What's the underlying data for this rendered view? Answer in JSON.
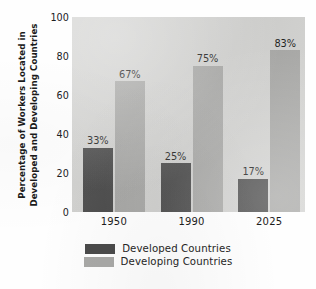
{
  "chart_data": {
    "type": "bar",
    "title": "",
    "subtitle": "",
    "xlabel": "",
    "ylabel_lines": [
      "Percentage of Workers Located in",
      "Developed and Developing Countries"
    ],
    "categories": [
      "1950",
      "1990",
      "2025"
    ],
    "series": [
      {
        "name": "Developed Countries",
        "color": "#4b4b4b",
        "values": [
          33,
          25,
          17
        ],
        "data_labels": [
          "33%",
          "25%",
          "17%"
        ]
      },
      {
        "name": "Developing Countries",
        "color": "#a9a9a7",
        "values": [
          67,
          75,
          83
        ],
        "data_labels": [
          "67%",
          "75%",
          "83%"
        ]
      }
    ],
    "ylim": [
      0,
      100
    ],
    "yticks": [
      0,
      20,
      40,
      60,
      80,
      100
    ],
    "ytick_labels": [
      "0",
      "20",
      "40",
      "60",
      "80",
      "100"
    ],
    "grid": false,
    "legend_position": "bottom",
    "plot_background": "#d3d3d1",
    "page_background": "#fefefe"
  },
  "legend": {
    "entries": [
      {
        "label": "Developed Countries",
        "color": "#4b4b4b"
      },
      {
        "label": "Developing Countries",
        "color": "#a9a9a7"
      }
    ]
  }
}
